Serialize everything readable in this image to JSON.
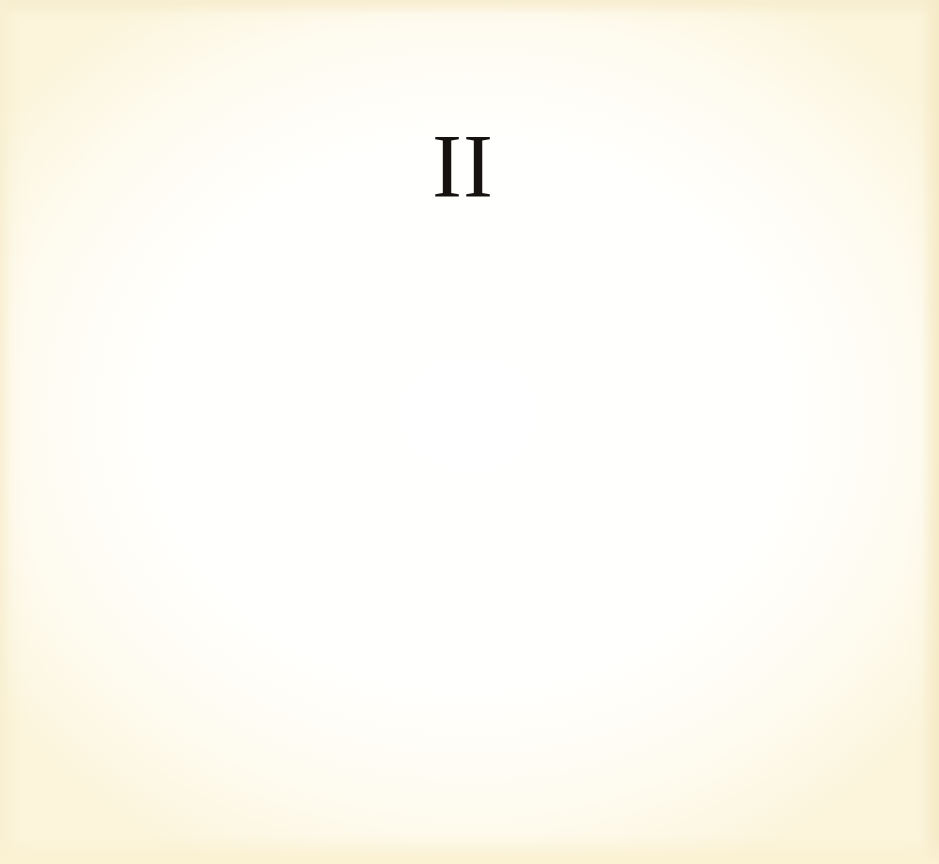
{
  "page": {
    "chapter_numeral": "II",
    "colors": {
      "paper": "#fffffd",
      "paper_edge": "#fcf5dc",
      "ink": "#151210"
    }
  }
}
